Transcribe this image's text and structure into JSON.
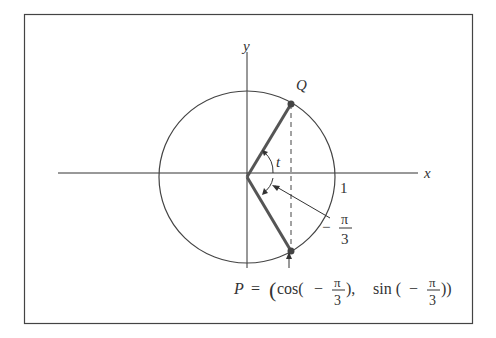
{
  "figure": {
    "axis_labels": {
      "x": "x",
      "y": "y"
    },
    "tick_one": "1",
    "point_Q": "Q",
    "angle_t": "t",
    "angle_neg": {
      "minus": "−",
      "num": "π",
      "den": "3"
    },
    "point_P_eq": {
      "P": "P",
      "eq": "=",
      "open": "(",
      "cos": "cos(",
      "minus1": "−",
      "num1": "π",
      "den1": "3",
      "close1": "),",
      "sin": "sin (",
      "minus2": "−",
      "num2": "π",
      "den2": "3",
      "close2": "))"
    },
    "colors": {
      "line": "#333333",
      "thick": "#555555",
      "frame": "#444444"
    }
  }
}
